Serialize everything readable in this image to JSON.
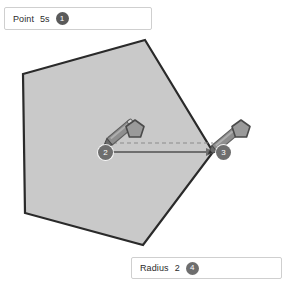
{
  "canvas": {
    "background_color": "#ffffff",
    "shape": {
      "name": "pentagon",
      "fill_color": "#c9c9c9",
      "stroke_color": "#2a2a2a",
      "vertices": [
        [
          145,
          40
        ],
        [
          213,
          152
        ],
        [
          143,
          245
        ],
        [
          25,
          213
        ],
        [
          23,
          74
        ]
      ]
    },
    "guide_line": {
      "style": "dashed",
      "color": "#8c8c8c",
      "from": [
        106,
        143
      ],
      "to": [
        213,
        143
      ]
    },
    "radius_arrow": {
      "style": "solid-arrow",
      "color": "#6e6e6e",
      "from": [
        108,
        152
      ],
      "to": [
        215,
        152
      ]
    }
  },
  "annotations": {
    "pen_cursors": [
      {
        "name": "pen-cursor-center",
        "tip": [
          108,
          143
        ],
        "angle_deg": -40
      },
      {
        "name": "pen-cursor-vertex",
        "tip": [
          213,
          150
        ],
        "angle_deg": -40
      }
    ],
    "shape_markers": [
      {
        "name": "pentagon-marker-center",
        "at": [
          135,
          130
        ]
      },
      {
        "name": "pentagon-marker-vertex",
        "at": [
          240,
          130
        ]
      }
    ]
  },
  "steps": {
    "point_tool": {
      "label": "Point",
      "value": "5s",
      "badge": "1"
    },
    "point_start": {
      "badge": "2"
    },
    "point_end": {
      "badge": "3"
    },
    "radius_tool": {
      "label": "Radius",
      "value": "2",
      "badge": "4"
    }
  },
  "colors": {
    "shape_fill": "#c9c9c9",
    "shape_stroke": "#2a2a2a",
    "badge_bg": "#6e6e6e",
    "badge_bg_dark": "#5a5a5a",
    "guide": "#8c8c8c",
    "chip_border": "#cfcfcf"
  }
}
